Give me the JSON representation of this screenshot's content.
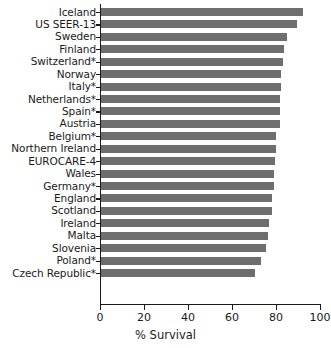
{
  "chart_data": {
    "type": "bar",
    "orientation": "horizontal",
    "title": "",
    "xlabel": "% Survival",
    "ylabel": "",
    "xlim": [
      0,
      100
    ],
    "xticks": [
      0,
      20,
      40,
      60,
      80,
      100
    ],
    "grid": false,
    "legend": null,
    "bar_color": "#6e6e6e",
    "axis_color": "#1a1a1a",
    "categories": [
      "Iceland",
      "US SEER-13",
      "Sweden",
      "Finland",
      "Switzerland*",
      "Norway",
      "Italy*",
      "Netherlands*",
      "Spain*",
      "Austria",
      "Belgium*",
      "Northern Ireland",
      "EUROCARE-4",
      "Wales",
      "Germany*",
      "England",
      "Scotland",
      "Ireland",
      "Malta",
      "Slovenia",
      "Poland*",
      "Czech Republic*"
    ],
    "values": [
      92.1,
      89.4,
      84.9,
      83.6,
      83.0,
      82.4,
      82.2,
      82.0,
      81.9,
      81.6,
      80.2,
      80.0,
      79.5,
      79.3,
      79.0,
      78.4,
      78.0,
      77.0,
      76.5,
      75.3,
      73.2,
      70.5
    ]
  }
}
